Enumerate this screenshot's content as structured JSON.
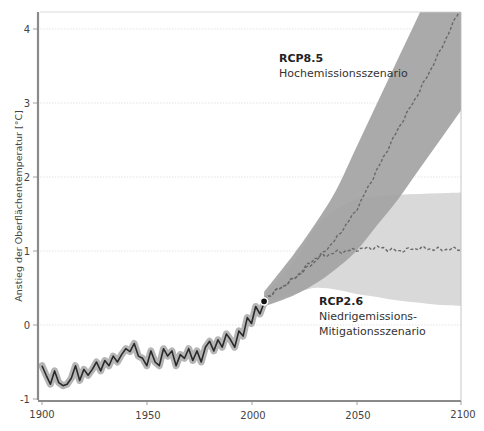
{
  "chart_data": {
    "type": "line",
    "title": "",
    "xlabel": "",
    "ylabel": "Anstieg der Oberflächentemperatur [°C]",
    "xlim": [
      1900,
      2100
    ],
    "ylim": [
      -1,
      4.2
    ],
    "x_ticks": [
      "1900",
      "1950",
      "2000",
      "2050",
      "2100"
    ],
    "y_ticks": [
      "-1",
      "0",
      "1",
      "2",
      "3",
      "4"
    ],
    "grid": {
      "horizontal": true,
      "vertical": false,
      "style": "dotted"
    },
    "colors": {
      "observed_line": "#2a2a2a",
      "observed_halo": "#b5b5b5",
      "rcp85_band": "#a3a3a3",
      "rcp26_band": "#d9d9d9",
      "overlap_band": "#9a9a9a",
      "mean_dashed": "#6a6a6a",
      "axis": "#8a8a8a"
    },
    "series": [
      {
        "name": "Beobachtet",
        "style": "solid",
        "x": [
          1900,
          1902,
          1904,
          1906,
          1908,
          1910,
          1912,
          1914,
          1916,
          1918,
          1920,
          1922,
          1924,
          1926,
          1928,
          1930,
          1932,
          1934,
          1936,
          1938,
          1940,
          1942,
          1944,
          1946,
          1948,
          1950,
          1952,
          1954,
          1956,
          1958,
          1960,
          1962,
          1964,
          1966,
          1968,
          1970,
          1972,
          1974,
          1976,
          1978,
          1980,
          1982,
          1984,
          1986,
          1988,
          1990,
          1992,
          1994,
          1996,
          1998,
          2000,
          2002,
          2004,
          2006
        ],
        "values": [
          -0.55,
          -0.68,
          -0.8,
          -0.62,
          -0.78,
          -0.82,
          -0.8,
          -0.72,
          -0.55,
          -0.75,
          -0.6,
          -0.68,
          -0.6,
          -0.5,
          -0.62,
          -0.48,
          -0.55,
          -0.42,
          -0.5,
          -0.4,
          -0.32,
          -0.36,
          -0.25,
          -0.42,
          -0.45,
          -0.55,
          -0.35,
          -0.5,
          -0.55,
          -0.32,
          -0.42,
          -0.35,
          -0.55,
          -0.4,
          -0.45,
          -0.32,
          -0.48,
          -0.35,
          -0.5,
          -0.3,
          -0.22,
          -0.35,
          -0.2,
          -0.3,
          -0.12,
          -0.2,
          -0.3,
          -0.08,
          -0.15,
          0.1,
          0.02,
          0.25,
          0.15,
          0.3
        ]
      },
      {
        "name": "RCP8.5 Mittelwert",
        "style": "dashed",
        "x": [
          2006,
          2020,
          2030,
          2040,
          2050,
          2060,
          2070,
          2080,
          2090,
          2100
        ],
        "values": [
          0.35,
          0.62,
          0.85,
          1.15,
          1.55,
          2.1,
          2.65,
          3.15,
          3.7,
          4.3
        ],
        "band_upper": [
          0.45,
          0.95,
          1.35,
          1.8,
          2.4,
          3.0,
          3.6,
          4.2,
          4.8,
          5.3
        ],
        "band_lower": [
          0.25,
          0.4,
          0.55,
          0.75,
          1.0,
          1.35,
          1.7,
          2.1,
          2.5,
          2.9
        ]
      },
      {
        "name": "RCP2.6 Mittelwert",
        "style": "dashed",
        "x": [
          2006,
          2020,
          2030,
          2040,
          2050,
          2060,
          2070,
          2080,
          2090,
          2100
        ],
        "values": [
          0.35,
          0.62,
          0.9,
          0.98,
          1.02,
          1.05,
          1.0,
          1.04,
          1.02,
          1.03
        ],
        "band_upper": [
          0.4,
          0.85,
          1.3,
          1.55,
          1.7,
          1.74,
          1.76,
          1.77,
          1.78,
          1.79
        ],
        "band_lower": [
          0.3,
          0.42,
          0.5,
          0.48,
          0.42,
          0.38,
          0.33,
          0.3,
          0.27,
          0.26
        ]
      }
    ],
    "marker": {
      "x": 2006,
      "y": 0.32,
      "label": ""
    },
    "annotations": [
      {
        "title": "RCP8.5",
        "subtitle": [
          "Hochemissionsszenario"
        ]
      },
      {
        "title": "RCP2.6",
        "subtitle": [
          "Niedrigemissions-",
          "Mitigationsszenario"
        ]
      }
    ],
    "legend": null
  },
  "labels": {
    "ylabel": "Anstieg der Oberflächentemperatur [°C]",
    "rcp85_title": "RCP8.5",
    "rcp85_sub": "Hochemissionsszenario",
    "rcp26_title": "RCP2.6",
    "rcp26_sub1": "Niedrigemissions-",
    "rcp26_sub2": "Mitigationsszenario",
    "x_ticks": [
      "1900",
      "1950",
      "2000",
      "2050",
      "2100"
    ],
    "y_ticks": [
      "4",
      "3",
      "2",
      "1",
      "0",
      "-1"
    ]
  }
}
